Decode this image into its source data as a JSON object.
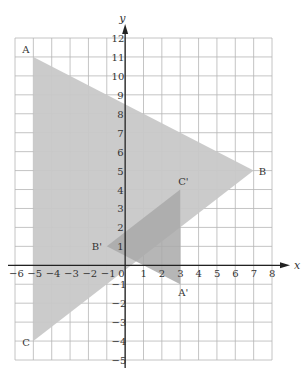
{
  "diagram": {
    "type": "coordinate-plane-transformation",
    "axes": {
      "x_label": "x",
      "y_label": "y",
      "x_range": [
        -6,
        8
      ],
      "y_range": [
        -5,
        12
      ],
      "x_ticks": [
        "-6",
        "-5",
        "-4",
        "-3",
        "-2",
        "-1",
        "0",
        "1",
        "2",
        "3",
        "4",
        "5",
        "6",
        "7",
        "8"
      ],
      "y_ticks": [
        "12",
        "11",
        "10",
        "9",
        "8",
        "7",
        "6",
        "5",
        "4",
        "3",
        "2",
        "1",
        "-1",
        "-2",
        "-3",
        "-4",
        "-5"
      ]
    },
    "shapes": [
      {
        "name": "triangle-ABC",
        "fill": "#c8c8c8",
        "vertices": [
          {
            "label": "A",
            "x": -5,
            "y": 11
          },
          {
            "label": "B",
            "x": 7,
            "y": 5
          },
          {
            "label": "C",
            "x": -5,
            "y": -4
          }
        ]
      },
      {
        "name": "triangle-A'B'C'",
        "fill": "#a9a9a9",
        "vertices": [
          {
            "label": "A'",
            "x": 3,
            "y": -1
          },
          {
            "label": "B'",
            "x": -1,
            "y": 1
          },
          {
            "label": "C'",
            "x": 3,
            "y": 4
          }
        ]
      }
    ],
    "colors": {
      "grid": "#b5b5b5",
      "axis": "#222222",
      "large_triangle": "#c8c8c8",
      "small_triangle": "#a9a9a9"
    }
  }
}
